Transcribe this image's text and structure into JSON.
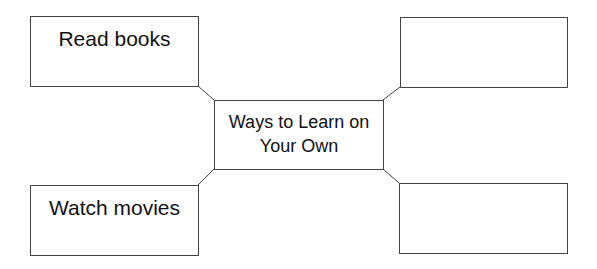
{
  "diagram": {
    "center": {
      "label": "Ways to Learn on Your Own"
    },
    "nodes": [
      {
        "id": "top-left",
        "label": "Read books"
      },
      {
        "id": "top-right",
        "label": ""
      },
      {
        "id": "bottom-left",
        "label": "Watch movies"
      },
      {
        "id": "bottom-right",
        "label": ""
      }
    ],
    "colors": {
      "stroke": "#444444",
      "text": "#111111",
      "background": "#ffffff"
    }
  }
}
